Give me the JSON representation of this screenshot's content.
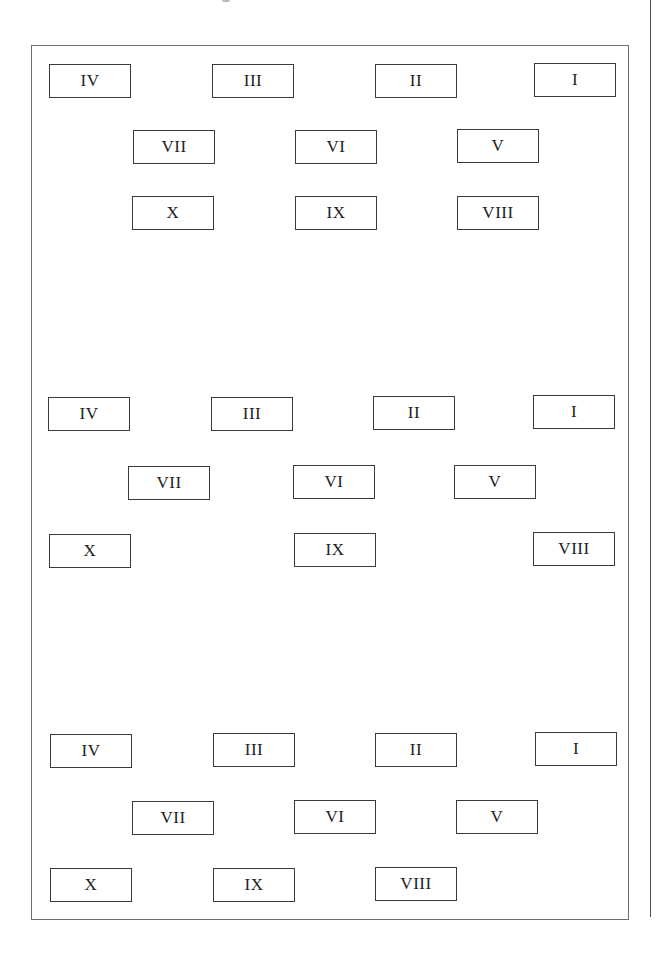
{
  "figure": {
    "frame": {
      "left": 31,
      "top": 45,
      "width": 598,
      "height": 875
    },
    "side_rule": {
      "left": 650,
      "top": 0,
      "height": 917
    },
    "groups": [
      {
        "name": "arrangement-1",
        "boxes": [
          {
            "label": "IV",
            "x": 49,
            "y": 64
          },
          {
            "label": "III",
            "x": 212,
            "y": 64
          },
          {
            "label": "II",
            "x": 375,
            "y": 64
          },
          {
            "label": "I",
            "x": 534,
            "y": 63
          },
          {
            "label": "VII",
            "x": 133,
            "y": 130
          },
          {
            "label": "VI",
            "x": 295,
            "y": 130
          },
          {
            "label": "V",
            "x": 457,
            "y": 129
          },
          {
            "label": "X",
            "x": 132,
            "y": 196
          },
          {
            "label": "IX",
            "x": 295,
            "y": 196
          },
          {
            "label": "VIII",
            "x": 457,
            "y": 196
          }
        ]
      },
      {
        "name": "arrangement-2",
        "boxes": [
          {
            "label": "IV",
            "x": 48,
            "y": 397
          },
          {
            "label": "III",
            "x": 211,
            "y": 397
          },
          {
            "label": "II",
            "x": 373,
            "y": 396
          },
          {
            "label": "I",
            "x": 533,
            "y": 395
          },
          {
            "label": "VII",
            "x": 128,
            "y": 466
          },
          {
            "label": "VI",
            "x": 293,
            "y": 465
          },
          {
            "label": "V",
            "x": 454,
            "y": 465
          },
          {
            "label": "X",
            "x": 49,
            "y": 534
          },
          {
            "label": "IX",
            "x": 294,
            "y": 533
          },
          {
            "label": "VIII",
            "x": 533,
            "y": 532
          }
        ]
      },
      {
        "name": "arrangement-3",
        "boxes": [
          {
            "label": "IV",
            "x": 50,
            "y": 734
          },
          {
            "label": "III",
            "x": 213,
            "y": 733
          },
          {
            "label": "II",
            "x": 375,
            "y": 733
          },
          {
            "label": "I",
            "x": 535,
            "y": 732
          },
          {
            "label": "VII",
            "x": 132,
            "y": 801
          },
          {
            "label": "VI",
            "x": 294,
            "y": 800
          },
          {
            "label": "V",
            "x": 456,
            "y": 800
          },
          {
            "label": "X",
            "x": 50,
            "y": 868
          },
          {
            "label": "IX",
            "x": 213,
            "y": 868
          },
          {
            "label": "VIII",
            "x": 375,
            "y": 867
          }
        ]
      }
    ]
  }
}
